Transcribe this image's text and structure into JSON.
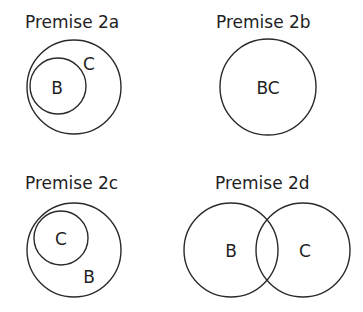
{
  "panels": [
    {
      "id": "2a",
      "title": "Premise 2a",
      "description": "B is entirely contained within C",
      "circles": [
        {
          "set": "C",
          "cx": 74,
          "cy": 87,
          "r": 47
        },
        {
          "set": "B",
          "cx": 58,
          "cy": 86,
          "r": 28
        }
      ],
      "labels": [
        {
          "text": "B",
          "x": 57,
          "y": 94
        },
        {
          "text": "C",
          "x": 89,
          "y": 70
        }
      ]
    },
    {
      "id": "2b",
      "title": "Premise 2b",
      "description": "B and C are identical",
      "circles": [
        {
          "set": "BC",
          "cx": 268,
          "cy": 87,
          "r": 48
        }
      ],
      "labels": [
        {
          "text": "BC",
          "x": 268,
          "y": 94
        }
      ]
    },
    {
      "id": "2c",
      "title": "Premise 2c",
      "description": "C is entirely contained within B",
      "circles": [
        {
          "set": "B",
          "cx": 74,
          "cy": 250,
          "r": 47
        },
        {
          "set": "C",
          "cx": 61,
          "cy": 238,
          "r": 27
        }
      ],
      "labels": [
        {
          "text": "C",
          "x": 61,
          "y": 245
        },
        {
          "text": "B",
          "x": 89,
          "y": 283
        }
      ]
    },
    {
      "id": "2d",
      "title": "Premise 2d",
      "description": "B and C partially overlap",
      "circles": [
        {
          "set": "B",
          "cx": 231,
          "cy": 250,
          "r": 47
        },
        {
          "set": "C",
          "cx": 303,
          "cy": 250,
          "r": 47
        }
      ],
      "labels": [
        {
          "text": "B",
          "x": 231,
          "y": 257
        },
        {
          "text": "C",
          "x": 305,
          "y": 257
        }
      ]
    }
  ],
  "colors": {
    "stroke": "#2a2a2a",
    "text": "#1e1e1e",
    "background": "#ffffff"
  }
}
